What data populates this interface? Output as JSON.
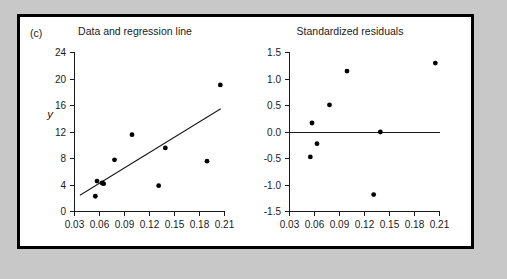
{
  "figure": {
    "panel_tag": "(c)",
    "background_color": "#c8c8c8",
    "panel_color": "#ffffff",
    "frame_color": "#000000"
  },
  "chart_data": [
    {
      "type": "scatter",
      "title": "Data and regression line",
      "xlabel": "",
      "ylabel": "y",
      "xlim": [
        0.03,
        0.21
      ],
      "ylim": [
        0,
        24
      ],
      "xticks": [
        0.03,
        0.06,
        0.09,
        0.12,
        0.15,
        0.18,
        0.21
      ],
      "xticklabels": [
        "0.03",
        "0.06",
        "0.09",
        "0.12",
        "0.15",
        "0.18",
        "0.21"
      ],
      "yticks": [
        0,
        4,
        8,
        12,
        16,
        20,
        24
      ],
      "yticklabels": [
        "0",
        "4",
        "8",
        "12",
        "16",
        "20",
        "24"
      ],
      "grid": false,
      "legend": "none",
      "x": [
        0.055,
        0.057,
        0.063,
        0.065,
        0.078,
        0.099,
        0.131,
        0.139,
        0.189,
        0.205
      ],
      "y": [
        2.3,
        4.6,
        4.3,
        4.2,
        7.8,
        11.6,
        3.9,
        9.6,
        7.6,
        19.1
      ],
      "regression_line": {
        "x_start": 0.0365,
        "y_start": 2.45,
        "x_end": 0.2055,
        "y_end": 15.5
      }
    },
    {
      "type": "scatter",
      "title": "Standardized residuals",
      "xlabel": "",
      "ylabel": "",
      "xlim": [
        0.03,
        0.21
      ],
      "ylim": [
        -1.5,
        1.5
      ],
      "xticks": [
        0.03,
        0.06,
        0.09,
        0.12,
        0.15,
        0.18,
        0.21
      ],
      "xticklabels": [
        "0.03",
        "0.06",
        "0.09",
        "0.12",
        "0.15",
        "0.18",
        "0.21"
      ],
      "yticks": [
        -1.5,
        -1.0,
        -0.5,
        0.0,
        0.5,
        1.0,
        1.5
      ],
      "yticklabels": [
        "-1.5",
        "-1.0",
        "-0.5",
        "0.0",
        "0.5",
        "1.0",
        "1.5"
      ],
      "grid": false,
      "legend": "none",
      "reference_line_y": 0.0,
      "x": [
        0.055,
        0.057,
        0.063,
        0.078,
        0.099,
        0.131,
        0.139,
        0.205
      ],
      "y": [
        -0.47,
        0.17,
        -0.22,
        0.51,
        1.15,
        -1.18,
        0.0,
        1.3
      ]
    }
  ]
}
